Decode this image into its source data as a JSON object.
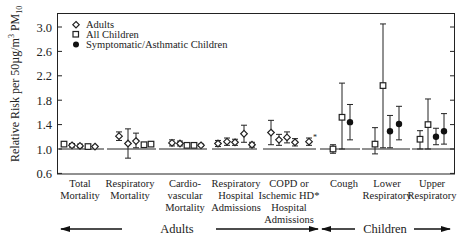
{
  "chart_data": {
    "type": "scatter",
    "subtype": "point-with-error-bars",
    "title": "",
    "ylabel": "Relative Risk per 50µg/m³ PM10",
    "ylabel_parts": {
      "main": "Relative Risk per 50µg/m",
      "sup": "3",
      "mid": " PM",
      "sub": "10"
    },
    "ylim": [
      0.6,
      3.2
    ],
    "yticks": [
      0.6,
      1.0,
      1.4,
      1.8,
      2.2,
      2.6,
      3.0
    ],
    "ytick_labels": [
      "0.6",
      "1.0",
      "1.4",
      "1.8",
      "2.2",
      "2.6",
      "3.0"
    ],
    "reference_line": 1.0,
    "grid": false,
    "legend": {
      "position": "upper-left",
      "entries": [
        {
          "name": "Adults",
          "marker": "open-diamond"
        },
        {
          "name": "All Children",
          "marker": "open-square"
        },
        {
          "name": "Symptomatic/Asthmatic Children",
          "marker": "filled-circle"
        }
      ]
    },
    "groups": [
      {
        "name": "Adults",
        "label": "Adults"
      },
      {
        "name": "Children",
        "label": "Children"
      }
    ],
    "categories": [
      {
        "label": [
          "Total",
          "Mortality"
        ],
        "group": "Adults",
        "points": [
          {
            "series": "All Children",
            "marker": "open-square",
            "rr": 1.08,
            "lo": 1.05,
            "hi": 1.1
          },
          {
            "series": "Adults",
            "marker": "open-diamond",
            "rr": 1.06,
            "lo": 1.03,
            "hi": 1.09
          },
          {
            "series": "Adults",
            "marker": "open-diamond",
            "rr": 1.05,
            "lo": 1.02,
            "hi": 1.08
          },
          {
            "series": "Adults",
            "marker": "open-square",
            "rr": 1.04,
            "lo": 1.03,
            "hi": 1.05
          },
          {
            "series": "Adults",
            "marker": "open-diamond",
            "rr": 1.04,
            "lo": 1.03,
            "hi": 1.05
          }
        ]
      },
      {
        "label": [
          "Respiratory",
          "Mortality"
        ],
        "group": "Adults",
        "points": [
          {
            "series": "Adults",
            "marker": "open-diamond",
            "rr": 1.21,
            "lo": 1.14,
            "hi": 1.28
          },
          {
            "series": "Adults",
            "marker": "open-diamond",
            "rr": 1.09,
            "lo": 0.85,
            "hi": 1.33
          },
          {
            "series": "Adults",
            "marker": "open-diamond",
            "rr": 1.13,
            "lo": 1.02,
            "hi": 1.26
          },
          {
            "series": "Adults",
            "marker": "open-square",
            "rr": 1.07,
            "lo": 1.05,
            "hi": 1.09
          },
          {
            "series": "Adults",
            "marker": "open-square",
            "rr": 1.08,
            "lo": 1.05,
            "hi": 1.11
          }
        ]
      },
      {
        "label": [
          "Cardio-",
          "vascular",
          "Mortality"
        ],
        "group": "Adults",
        "points": [
          {
            "series": "Adults",
            "marker": "open-diamond",
            "rr": 1.1,
            "lo": 1.05,
            "hi": 1.15
          },
          {
            "series": "Adults",
            "marker": "open-diamond",
            "rr": 1.09,
            "lo": 1.05,
            "hi": 1.13
          },
          {
            "series": "Adults",
            "marker": "open-square",
            "rr": 1.06,
            "lo": 1.04,
            "hi": 1.08
          },
          {
            "series": "Adults",
            "marker": "open-square",
            "rr": 1.06,
            "lo": 1.04,
            "hi": 1.08
          },
          {
            "series": "Adults",
            "marker": "open-diamond",
            "rr": 1.06,
            "lo": 1.04,
            "hi": 1.08
          }
        ]
      },
      {
        "label": [
          "Respiratory",
          "Hospital",
          "Admissions"
        ],
        "group": "Adults",
        "points": [
          {
            "series": "Adults",
            "marker": "open-diamond",
            "rr": 1.09,
            "lo": 1.04,
            "hi": 1.14
          },
          {
            "series": "Adults",
            "marker": "open-diamond",
            "rr": 1.12,
            "lo": 1.06,
            "hi": 1.18
          },
          {
            "series": "Adults",
            "marker": "open-diamond",
            "rr": 1.11,
            "lo": 1.06,
            "hi": 1.16
          },
          {
            "series": "Adults",
            "marker": "open-diamond",
            "rr": 1.25,
            "lo": 1.11,
            "hi": 1.39
          },
          {
            "series": "Adults",
            "marker": "open-diamond",
            "rr": 1.07,
            "lo": 1.03,
            "hi": 1.11
          }
        ]
      },
      {
        "label": [
          "COPD or",
          "Ischemic HD*",
          "Hospital",
          "Admissions"
        ],
        "group": "Adults",
        "points": [
          {
            "series": "Adults",
            "marker": "open-diamond",
            "rr": 1.27,
            "lo": 1.07,
            "hi": 1.47
          },
          {
            "series": "Adults",
            "marker": "open-diamond",
            "rr": 1.15,
            "lo": 1.06,
            "hi": 1.24
          },
          {
            "series": "Adults",
            "marker": "open-diamond",
            "rr": 1.19,
            "lo": 1.1,
            "hi": 1.28
          },
          {
            "series": "Adults",
            "marker": "open-diamond",
            "rr": 1.11,
            "lo": 1.05,
            "hi": 1.17
          },
          {
            "series": "Adults",
            "marker": "open-diamond",
            "rr": 1.12,
            "lo": 1.06,
            "hi": 1.18,
            "note": "*"
          }
        ]
      },
      {
        "label": [
          "Cough"
        ],
        "group": "Children",
        "points": [
          {
            "series": "All Children",
            "marker": "open-square",
            "rr": 1.0,
            "lo": 0.93,
            "hi": 1.07
          },
          {
            "series": "All Children",
            "marker": "open-square",
            "rr": 1.52,
            "lo": 1.0,
            "hi": 2.08
          },
          {
            "series": "Symptomatic/Asthmatic Children",
            "marker": "filled-circle",
            "rr": 1.44,
            "lo": 1.15,
            "hi": 1.73
          }
        ]
      },
      {
        "label": [
          "Lower",
          "Respiratory"
        ],
        "group": "Children",
        "points": [
          {
            "series": "All Children",
            "marker": "open-square",
            "rr": 1.08,
            "lo": 0.92,
            "hi": 1.35
          },
          {
            "series": "All Children",
            "marker": "open-square",
            "rr": 2.04,
            "lo": 1.02,
            "hi": 3.05
          },
          {
            "series": "Symptomatic/Asthmatic Children",
            "marker": "filled-circle",
            "rr": 1.29,
            "lo": 1.02,
            "hi": 1.55
          },
          {
            "series": "Symptomatic/Asthmatic Children",
            "marker": "filled-circle",
            "rr": 1.41,
            "lo": 1.15,
            "hi": 1.7
          }
        ]
      },
      {
        "label": [
          "Upper",
          "Respiratory"
        ],
        "group": "Children",
        "points": [
          {
            "series": "All Children",
            "marker": "open-square",
            "rr": 1.16,
            "lo": 1.0,
            "hi": 1.3
          },
          {
            "series": "All Children",
            "marker": "open-square",
            "rr": 1.4,
            "lo": 1.0,
            "hi": 1.82
          },
          {
            "series": "Symptomatic/Asthmatic Children",
            "marker": "filled-circle",
            "rr": 1.2,
            "lo": 1.07,
            "hi": 1.34
          },
          {
            "series": "Symptomatic/Asthmatic Children",
            "marker": "filled-circle",
            "rr": 1.29,
            "lo": 1.08,
            "hi": 1.58
          }
        ]
      }
    ]
  },
  "legend": {
    "adults": "Adults",
    "all_children": "All Children",
    "symptomatic": "Symptomatic/Asthmatic Children"
  },
  "axis": {
    "ylabel_main": "Relative Risk per 50µg/m",
    "ylabel_sup": "3",
    "ylabel_mid": " PM",
    "ylabel_sub": "10"
  },
  "groups": {
    "adults": "Adults",
    "children": "Children"
  }
}
